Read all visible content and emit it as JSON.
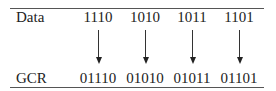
{
  "table": {
    "row_labels": {
      "data": "Data",
      "gcr": "GCR"
    },
    "columns": [
      {
        "data": "1110",
        "gcr": "01110"
      },
      {
        "data": "1010",
        "gcr": "01010"
      },
      {
        "data": "1011",
        "gcr": "01011"
      },
      {
        "data": "1101",
        "gcr": "01101"
      }
    ]
  }
}
